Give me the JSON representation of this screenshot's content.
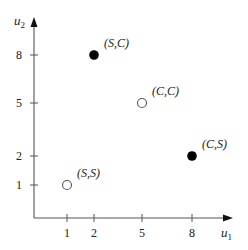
{
  "chart_data": {
    "type": "scatter",
    "title": "",
    "xlabel": "u1",
    "ylabel": "u2",
    "xlabel_main": "u",
    "xlabel_sub": "1",
    "ylabel_main": "u",
    "ylabel_sub": "2",
    "x_ticks": [
      1,
      2,
      5,
      8
    ],
    "y_ticks": [
      1,
      2,
      5,
      8
    ],
    "grid": false,
    "legend": "none",
    "points": [
      {
        "label": "(S,C)",
        "x": 2,
        "y": 8,
        "filled": true
      },
      {
        "label": "(C,C)",
        "x": 5,
        "y": 5,
        "filled": false
      },
      {
        "label": "(C,S)",
        "x": 8,
        "y": 2,
        "filled": true
      },
      {
        "label": "(S,S)",
        "x": 1,
        "y": 1,
        "filled": false
      }
    ]
  },
  "colors": {
    "axis": "#555555",
    "filled_point": "#000000",
    "hollow_point_stroke": "#555555",
    "text": "#222222"
  }
}
